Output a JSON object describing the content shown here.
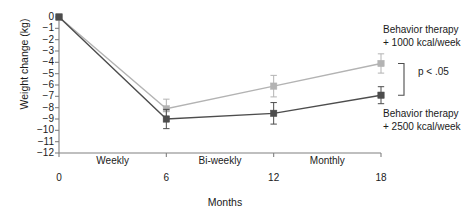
{
  "chart_data": {
    "type": "line",
    "title": "",
    "xlabel": "Months",
    "ylabel": "Weight change (kg)",
    "x": [
      0,
      6,
      12,
      18
    ],
    "xticklabels": [
      "0",
      "6",
      "12",
      "18"
    ],
    "xlim": [
      0,
      18
    ],
    "ylim": [
      -12,
      0
    ],
    "yticklabels": [
      "0",
      "−1",
      "−2",
      "−3",
      "−4",
      "−5",
      "−6",
      "−7",
      "−8",
      "−9",
      "−10",
      "−11",
      "−12"
    ],
    "yticks": [
      0,
      -1,
      -2,
      -3,
      -4,
      -5,
      -6,
      -7,
      -8,
      -9,
      -10,
      -11,
      -12
    ],
    "grid": false,
    "legend_position": "right-inline",
    "category_bands": [
      {
        "label": "Weekly",
        "start": 0,
        "end": 6
      },
      {
        "label": "Bi-weekly",
        "start": 6,
        "end": 12
      },
      {
        "label": "Monthly",
        "start": 12,
        "end": 18
      }
    ],
    "series": [
      {
        "name": "Behavior therapy + 1000 kcal/week",
        "label_line1": "Behavior therapy",
        "label_line2": "+ 1000 kcal/week",
        "color": "#b3b3b3",
        "marker": "square",
        "values": [
          0,
          -8.1,
          -6.1,
          -4.1
        ],
        "errors": [
          0,
          0.85,
          0.95,
          0.85
        ]
      },
      {
        "name": "Behavior therapy + 2500 kcal/week",
        "label_line1": "Behavior therapy",
        "label_line2": "+ 2500 kcal/week",
        "color": "#4d4d4d",
        "marker": "square",
        "values": [
          0,
          -9.0,
          -8.5,
          -6.9
        ],
        "errors": [
          0,
          0.85,
          0.95,
          0.75
        ]
      }
    ],
    "annotations": [
      {
        "name": "p-value",
        "text": "p < .05"
      }
    ]
  },
  "axis": {
    "color": "#808080"
  }
}
